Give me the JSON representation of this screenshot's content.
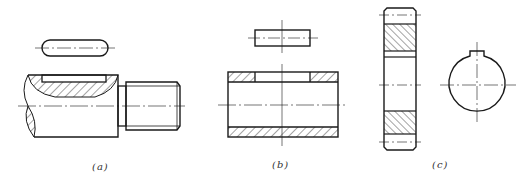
{
  "figure": {
    "panels": [
      {
        "id": "a",
        "label": "(a)",
        "content": "Rounded-end key above shaft section with keyway and threaded end"
      },
      {
        "id": "b",
        "label": "(b)",
        "content": "Rectangular key above hub/sleeve section with keyway"
      },
      {
        "id": "c",
        "label": "(c)",
        "content": "Gear cross-section and end view of bore with keyway"
      }
    ]
  },
  "colors": {
    "line": "#1a1a1a",
    "centerline": "#333333",
    "background": "#ffffff"
  }
}
